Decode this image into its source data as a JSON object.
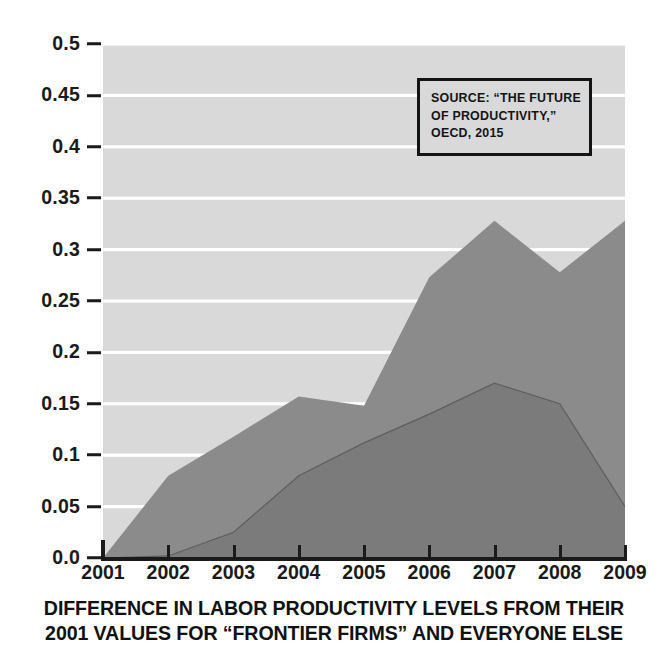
{
  "chart_data": {
    "type": "area",
    "title": "",
    "caption_lines": [
      "DIFFERENCE IN LABOR PRODUCTIVITY LEVELS FROM THEIR",
      "2001 VALUES FOR “FRONTIER FIRMS” AND EVERYONE ELSE"
    ],
    "x": [
      2001,
      2002,
      2003,
      2004,
      2005,
      2006,
      2007,
      2008,
      2009
    ],
    "xtick_labels": [
      "2001",
      "2002",
      "2003",
      "2004",
      "2005",
      "2006",
      "2007",
      "2008",
      "2009"
    ],
    "ytick_labels": [
      "0.0",
      "0.05",
      "0.1",
      "0.15",
      "0.2",
      "0.25",
      "0.3",
      "0.35",
      "0.4",
      "0.45",
      "0.5"
    ],
    "ytick_values": [
      0.0,
      0.05,
      0.1,
      0.15,
      0.2,
      0.25,
      0.3,
      0.35,
      0.4,
      0.45,
      0.5
    ],
    "xlim": [
      2001,
      2009
    ],
    "ylim": [
      0.0,
      0.5
    ],
    "xlabel": "",
    "ylabel": "",
    "grid": "horizontal-white",
    "legend": "none",
    "series": [
      {
        "name": "frontier-firms",
        "color": "#8b8b8b",
        "values": [
          0.0,
          0.08,
          0.118,
          0.157,
          0.148,
          0.273,
          0.328,
          0.278,
          0.328
        ]
      },
      {
        "name": "everyone-else",
        "color": "#7b7b7b",
        "values": [
          0.0,
          0.002,
          0.025,
          0.08,
          0.112,
          0.14,
          0.17,
          0.15,
          0.05
        ]
      }
    ],
    "annotations": [
      {
        "name": "source-note",
        "lines": [
          "SOURCE: “THE FUTURE",
          "OF PRODUCTIVITY,”",
          "OECD, 2015"
        ]
      }
    ],
    "colors": {
      "plot_background": "#d9d9d9",
      "gridline": "#ffffff",
      "axis": "#1a1a1a",
      "text": "#111111",
      "series_light": "#8b8b8b",
      "series_dark": "#7b7b7b",
      "page_background": "#ffffff"
    }
  }
}
